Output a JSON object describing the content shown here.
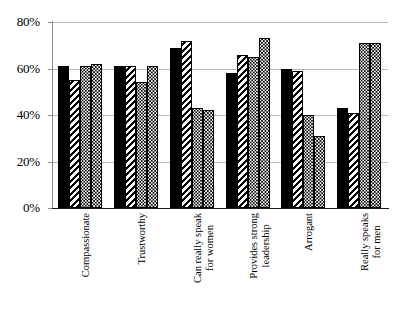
{
  "chart_data": {
    "type": "bar",
    "title": "",
    "subtitle": "",
    "xlabel": "",
    "ylabel": "",
    "ylim": [
      0,
      80
    ],
    "yticks": [
      0,
      20,
      40,
      60,
      80
    ],
    "ytick_labels": [
      "0%",
      "20%",
      "40%",
      "60%",
      "80%"
    ],
    "grid": true,
    "legend": "none",
    "grouped": true,
    "categories": [
      "Compassionate",
      "Trustworthy",
      "Can really speak for women",
      "Provides strong leadership",
      "Arrogant",
      "Really speaks for men"
    ],
    "category_lines": [
      [
        "Compassionate",
        ""
      ],
      [
        "Trustworthy",
        ""
      ],
      [
        "Can really speak",
        "for women"
      ],
      [
        "Provides strong",
        "leadership"
      ],
      [
        "Arrogant",
        ""
      ],
      [
        "Really speaks",
        "for men"
      ]
    ],
    "series": [
      {
        "name": "Series 1",
        "pattern": "solid-black",
        "values": [
          61,
          61,
          69,
          58,
          60,
          43
        ]
      },
      {
        "name": "Series 2",
        "pattern": "diagonal-hatch",
        "values": [
          55,
          61,
          72,
          66,
          59,
          41
        ]
      },
      {
        "name": "Series 3",
        "pattern": "checkered-dots",
        "values": [
          61,
          54,
          43,
          65,
          40,
          71
        ]
      },
      {
        "name": "Series 4",
        "pattern": "dense-dots",
        "values": [
          62,
          61,
          42,
          73,
          31,
          71
        ]
      }
    ]
  },
  "colors": {
    "background": "#ffffff",
    "ink": "#000000",
    "gridline": "#b9b9b9",
    "axis": "#8c8c8c"
  }
}
